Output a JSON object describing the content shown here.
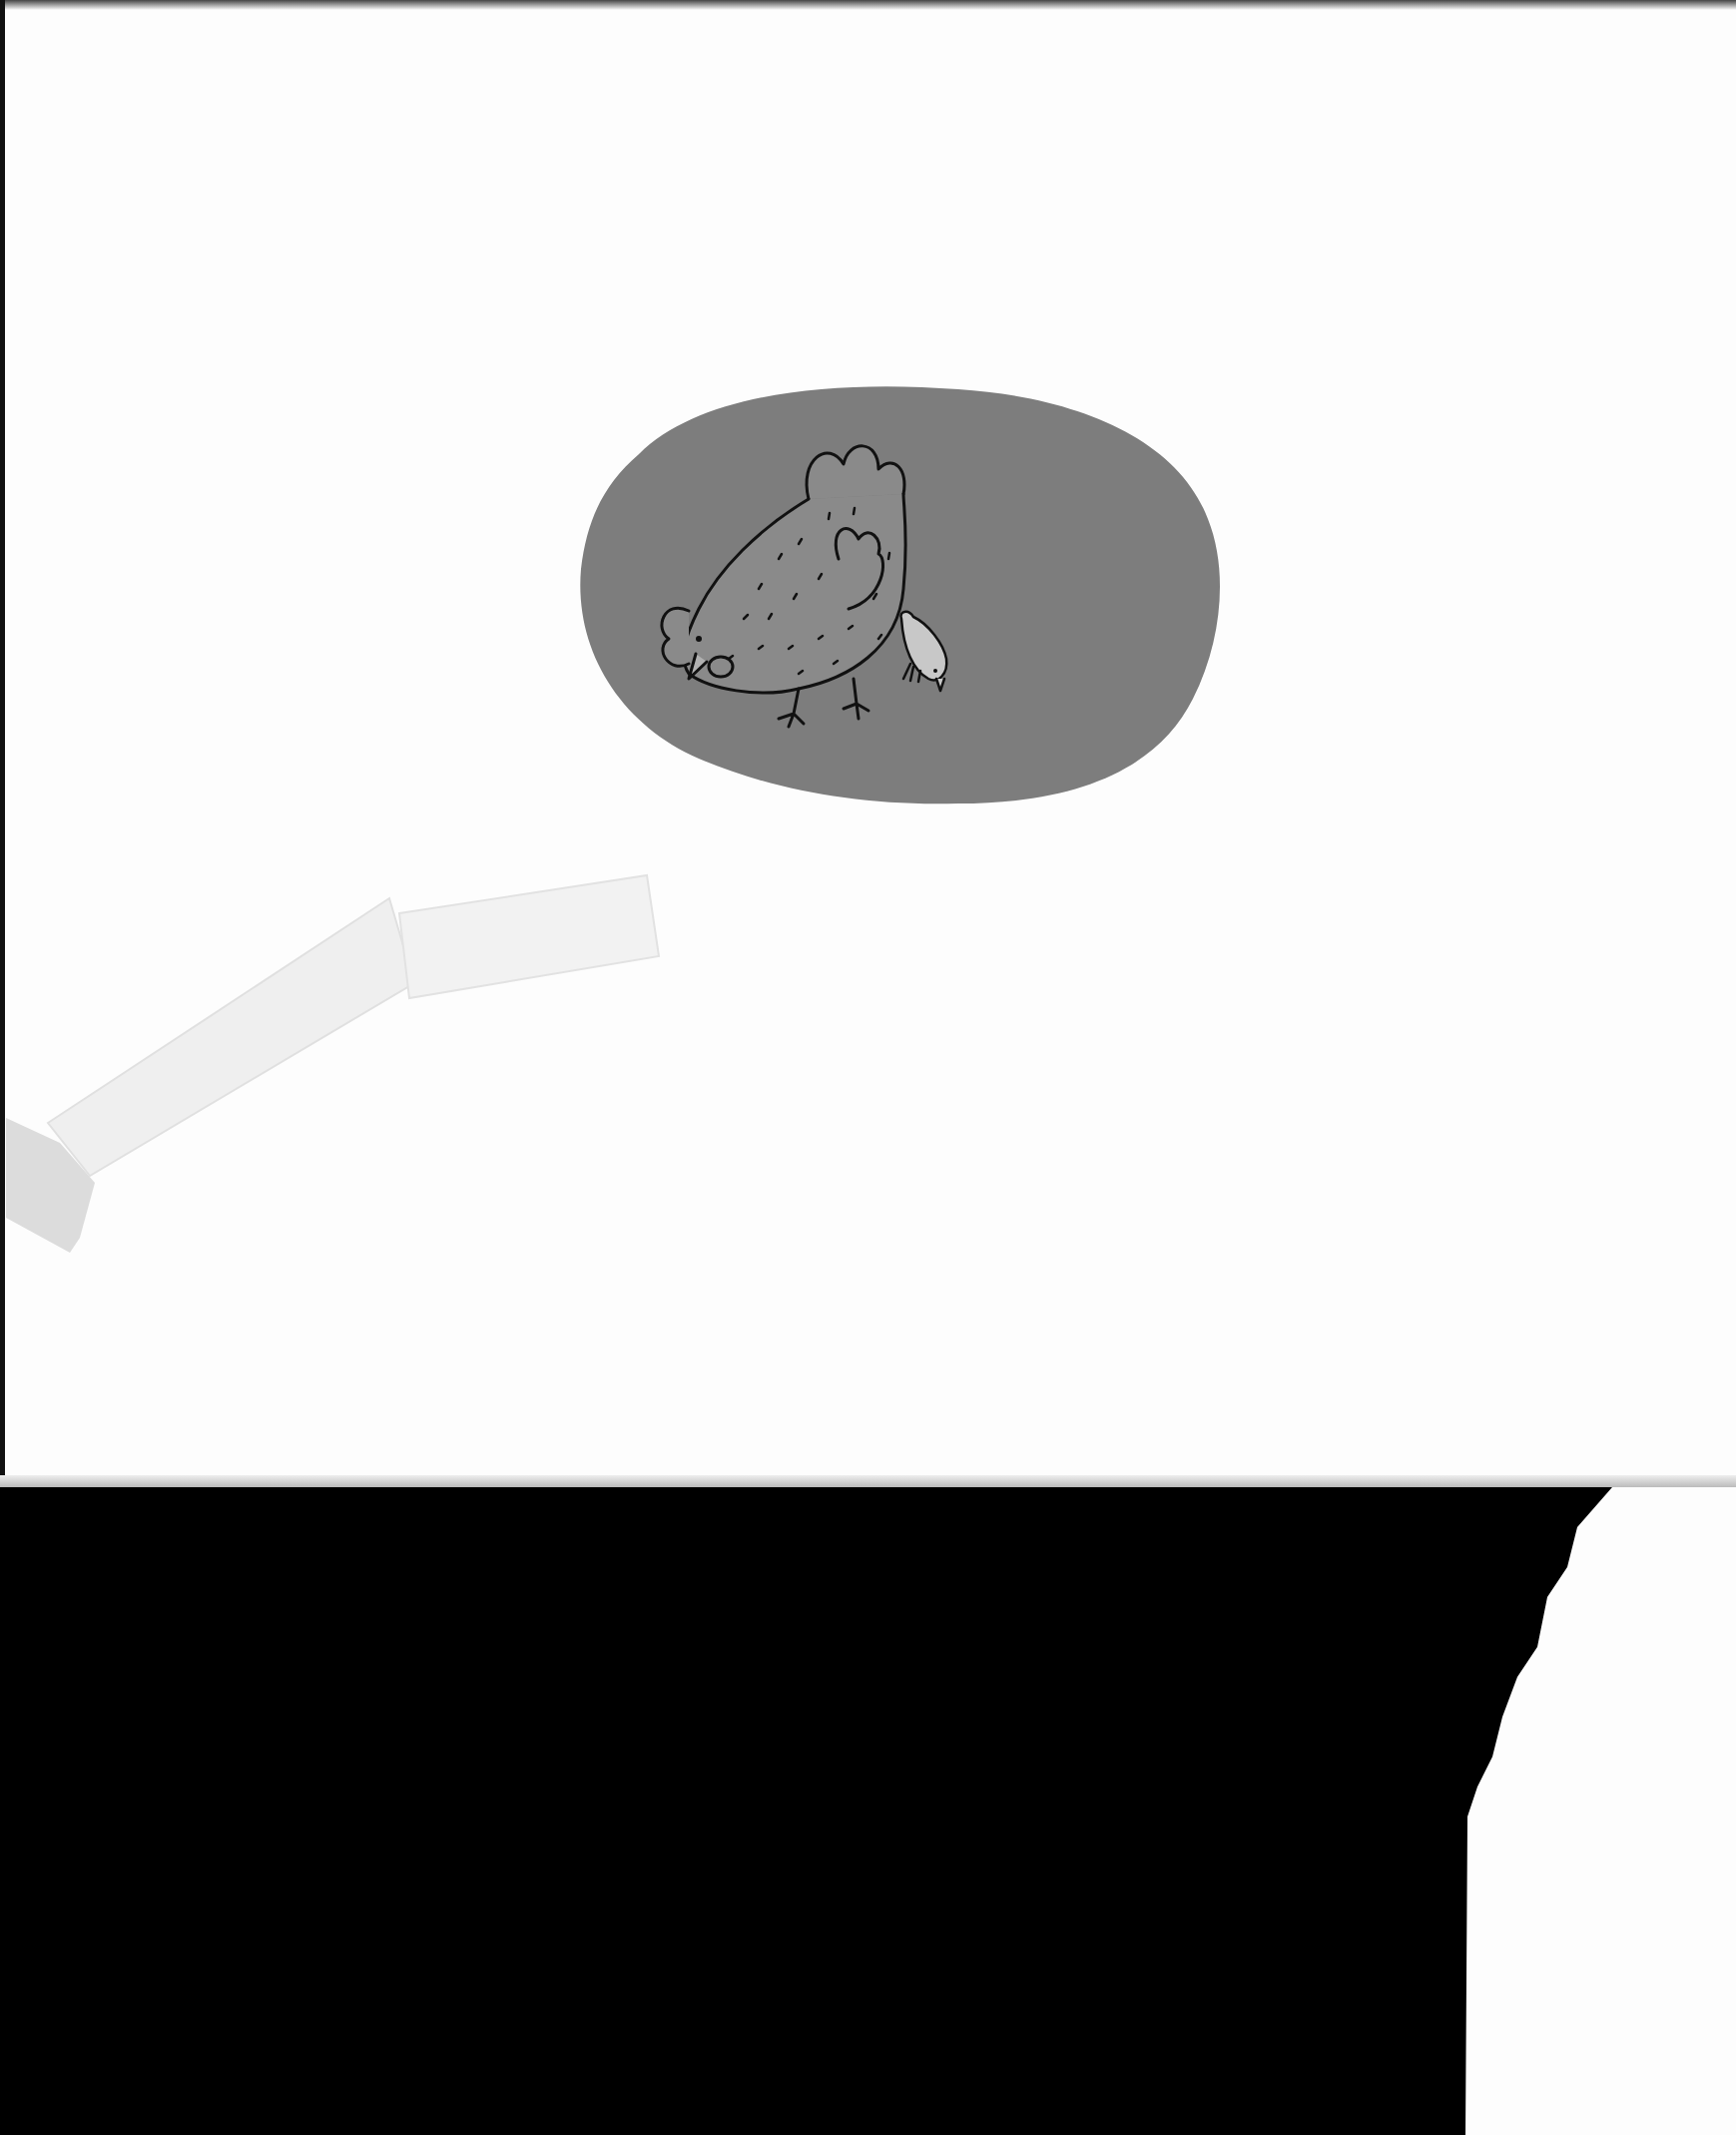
{
  "scene": {
    "description": "Scanned children's illustration: a speckled hen pecking beside a small chick on a gray oval blob, with masking tape on white paper over a black scanner background",
    "colors": {
      "paper": "#fdfdfd",
      "blob": "#7d7d7d",
      "hen_body": "#8a8a8a",
      "chick_body": "#c8c8c8",
      "outline": "#111111",
      "background": "#000000",
      "tape": "#ececec"
    },
    "figures": [
      "hen",
      "chick",
      "masking-tape"
    ]
  }
}
